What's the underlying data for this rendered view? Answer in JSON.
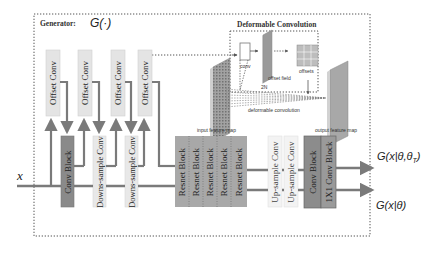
{
  "figure": {
    "generator_label": "Generator:",
    "generator_symbol": "G(·)",
    "input_symbol": "x",
    "deformable": {
      "title": "Deformable Convolution",
      "conv_label": "conv",
      "offset_field_label": "offset field",
      "offsets_label": "offsets",
      "two_n_label": "2N",
      "deform_conv_label": "deformable convolution",
      "input_map_label": "input feature map",
      "output_map_label": "output feature map"
    },
    "offset_convs": [
      "Offset Conv",
      "Offset Conv",
      "Offset Conv",
      "Offset Conv"
    ],
    "main_blocks": {
      "conv_block": "Conv Block",
      "downsample": [
        "Downs-sample Conv",
        "Downs-sample Conv"
      ],
      "resnet": [
        "Resnet Block",
        "Resnet Block",
        "Resnet Block",
        "Resnet Block",
        "Resnet Block"
      ],
      "upsample": [
        "Up-sample Conv",
        "Up-sample Conv"
      ],
      "final_conv_block": "Conv Block",
      "one_by_one": "1X1 Conv Block"
    },
    "outputs": {
      "top": "G(x|θ,θ",
      "top_sub": "T",
      "top_close": ")",
      "bottom": "G(x|θ)"
    }
  },
  "colors": {
    "arrow": "#7a7a7a",
    "dark_block": "#8a8a8a",
    "resnet_block": "#a8a8a8",
    "light_block": "#e6e6e6"
  }
}
